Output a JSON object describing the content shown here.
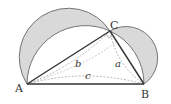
{
  "diagram": {
    "points": {
      "A": {
        "label": "A",
        "x": 27,
        "y": 84
      },
      "B": {
        "label": "B",
        "x": 144,
        "y": 84
      },
      "C": {
        "label": "C",
        "x": 110,
        "y": 31
      }
    },
    "sides": {
      "a": {
        "label": "a"
      },
      "b": {
        "label": "b"
      },
      "c": {
        "label": "c"
      }
    },
    "colors": {
      "lune_fill": "#d9d9d9",
      "stroke": "#555555",
      "dashed": "#999999",
      "triangle_edge": "#333333"
    }
  }
}
